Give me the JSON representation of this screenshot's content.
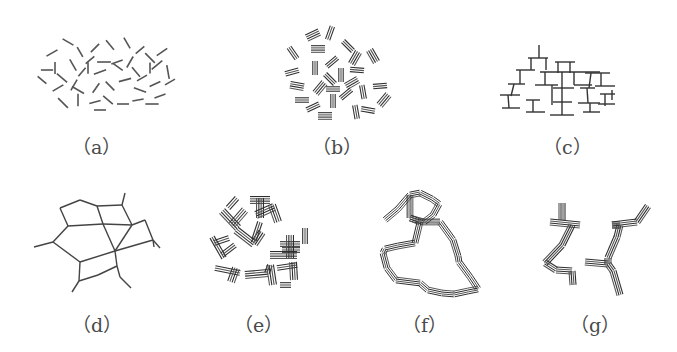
{
  "figure": {
    "stroke_color": "#3a3a3a",
    "background": "#ffffff",
    "panels": [
      {
        "id": "a",
        "label": "（a）",
        "description": "randomly oriented short line segments",
        "label_pos": [
          72,
          132
        ]
      },
      {
        "id": "b",
        "label": "（b）",
        "description": "clusters of parallel line segments",
        "label_pos": [
          312,
          132
        ]
      },
      {
        "id": "c",
        "label": "（c）",
        "description": "branching T-shaped tree structure",
        "label_pos": [
          543,
          132
        ]
      },
      {
        "id": "d",
        "label": "（d）",
        "description": "polygonal network graph",
        "label_pos": [
          72,
          310
        ]
      },
      {
        "id": "e",
        "label": "（e）",
        "description": "intersecting bundles of parallel lines",
        "label_pos": [
          234,
          310
        ]
      },
      {
        "id": "f",
        "label": "（f）",
        "description": "ring of parallel-line bundles",
        "label_pos": [
          402,
          310
        ]
      },
      {
        "id": "g",
        "label": "（g）",
        "description": "zig-zag chain of parallel-line bundles",
        "label_pos": [
          570,
          310
        ]
      }
    ]
  }
}
